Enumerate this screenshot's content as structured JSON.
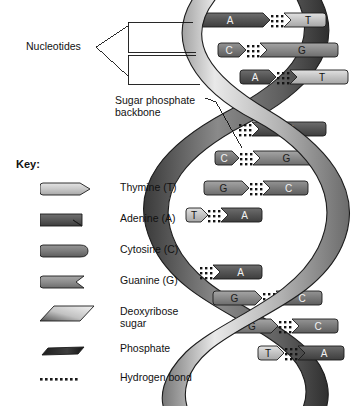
{
  "figure": {
    "background": "#ffffff",
    "ink": "#111111"
  },
  "callouts": {
    "nucleotides": {
      "label": "Nucleotides"
    },
    "backbone": {
      "line1": "Sugar phosphate",
      "line2": "backbone"
    }
  },
  "key": {
    "title": "Key:",
    "items": [
      {
        "name": "thymine",
        "label": "Thymine (T)",
        "label_line2": "",
        "swatch": "thymine-shape",
        "color": "#c9c9c9"
      },
      {
        "name": "adenine",
        "label": "Adenine (A)",
        "label_line2": "",
        "swatch": "adenine-shape",
        "color": "#5a5a5a"
      },
      {
        "name": "cytosine",
        "label": "Cytosine (C)",
        "label_line2": "",
        "swatch": "cytosine-shape",
        "color": "#7d7d7d"
      },
      {
        "name": "guanine",
        "label": "Guanine (G)",
        "label_line2": "",
        "swatch": "guanine-shape",
        "color": "#8f8f8f"
      },
      {
        "name": "deoxyribose",
        "label": "Deoxyribose",
        "label_line2": "sugar",
        "swatch": "sugar-shape",
        "color": "#b0b0b0"
      },
      {
        "name": "phosphate",
        "label": "Phosphate",
        "label_line2": "",
        "swatch": "phosphate-shape",
        "color": "#2e2e2e"
      },
      {
        "name": "hydrogen-bond",
        "label": "Hydrogen bond",
        "label_line2": "",
        "swatch": "hbond-dots",
        "color": "#222222"
      }
    ]
  },
  "helix": {
    "description": "Right-handed DNA double helix with two sugar-phosphate backbone ribbons and eleven base-pair rungs.",
    "backbone_ribbons": 2,
    "base_pairs": [
      {
        "index": 1,
        "left": "A",
        "right": "T",
        "y": 20,
        "left_x": 196,
        "right_x": 300,
        "bond_x": 276,
        "clipped": false
      },
      {
        "index": 2,
        "left": "C",
        "right": "G",
        "y": 50,
        "left_x": 218,
        "right_x": 312,
        "bond_x": 252,
        "clipped": false
      },
      {
        "index": 3,
        "left": "A",
        "right": "T",
        "y": 77,
        "left_x": 240,
        "right_x": 322,
        "bond_x": 282,
        "clipped": true
      },
      {
        "index": 4,
        "left": "",
        "right": "A",
        "y": 129,
        "left_x": 232,
        "right_x": 300,
        "bond_x": 244,
        "clipped": true
      },
      {
        "index": 5,
        "left": "C",
        "right": "G",
        "y": 158,
        "left_x": 215,
        "right_x": 288,
        "bond_x": 245,
        "clipped": false
      },
      {
        "index": 6,
        "left": "G",
        "right": "C",
        "y": 188,
        "left_x": 204,
        "right_x": 282,
        "bond_x": 255,
        "clipped": false
      },
      {
        "index": 7,
        "left": "T",
        "right": "A",
        "y": 215,
        "left_x": 186,
        "right_x": 236,
        "bond_x": 213,
        "clipped": false
      },
      {
        "index": 8,
        "left": "",
        "right": "A",
        "y": 272,
        "left_x": 190,
        "right_x": 236,
        "bond_x": 205,
        "clipped": true
      },
      {
        "index": 9,
        "left": "G",
        "right": "C",
        "y": 298,
        "left_x": 213,
        "right_x": 296,
        "bond_x": 268,
        "clipped": false
      },
      {
        "index": 10,
        "left": "G",
        "right": "C",
        "y": 326,
        "left_x": 232,
        "right_x": 312,
        "bond_x": 284,
        "clipped": false
      },
      {
        "index": 11,
        "left": "T",
        "right": "A",
        "y": 353,
        "left_x": 258,
        "right_x": 318,
        "bond_x": 290,
        "clipped": false
      }
    ],
    "base_colors": {
      "A": "#5c5c5c",
      "T": "#c9c9c9",
      "C": "#7d7d7d",
      "G": "#8e8e8e"
    }
  }
}
